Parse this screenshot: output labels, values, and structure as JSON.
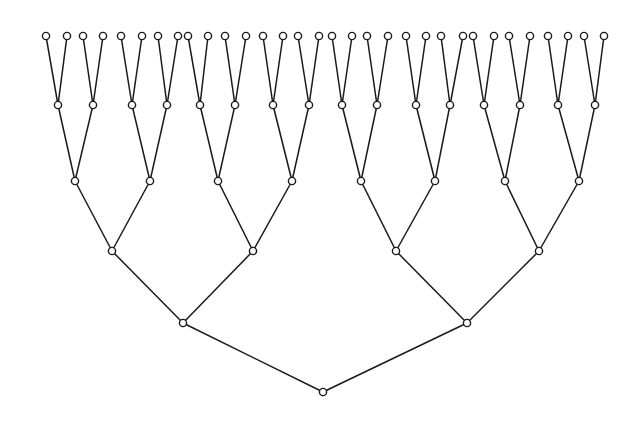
{
  "diagram": {
    "type": "complete-binary-tree",
    "depth": 5,
    "leaf_count": 32,
    "node_radius": 3.6,
    "colors": {
      "stroke": "#1a1a1a",
      "node_fill": "#ffffff",
      "background": "#ffffff"
    },
    "levels": [
      {
        "level": 0,
        "y": 392,
        "x": [
          323
        ]
      },
      {
        "level": 1,
        "y": 323,
        "x": [
          183,
          467
        ]
      },
      {
        "level": 2,
        "y": 251,
        "x": [
          112,
          253,
          396,
          539
        ]
      },
      {
        "level": 3,
        "y": 181,
        "x": [
          75,
          150,
          218,
          292,
          361,
          435,
          505,
          579
        ]
      },
      {
        "level": 4,
        "y": 105,
        "x": [
          58,
          93,
          132,
          167,
          200,
          235,
          273,
          309,
          342,
          377,
          416,
          450,
          484,
          520,
          558,
          595
        ]
      },
      {
        "level": 5,
        "y": 36,
        "x": [
          46,
          67,
          83,
          103,
          121,
          142,
          158,
          178,
          188,
          208,
          225,
          246,
          263,
          283,
          298,
          319,
          332,
          352,
          367,
          388,
          406,
          426,
          441,
          463,
          473,
          494,
          509,
          530,
          548,
          568,
          584,
          604
        ]
      }
    ]
  }
}
